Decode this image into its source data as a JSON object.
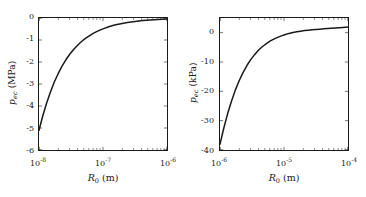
{
  "figure": {
    "background": "#ffffff",
    "line_color": "#1a1a1a",
    "axis_color": "#1a1a1a",
    "panels": [
      "left",
      "right"
    ]
  },
  "chart_data": [
    {
      "type": "line",
      "panel": "left",
      "title": "",
      "xlabel_text": "R0 (m)",
      "xlabel_var": "R",
      "xlabel_sub": "0",
      "xlabel_unit": " (m)",
      "ylabel_var": "p",
      "ylabel_sub": "ec",
      "ylabel_unit": " (MPa)",
      "xscale": "log",
      "yscale": "linear",
      "xlim": [
        1e-08,
        1e-06
      ],
      "ylim": [
        -6,
        0
      ],
      "xticks": [
        1e-08,
        1e-07,
        1e-06
      ],
      "xticklabels": [
        "10−8",
        "10−7",
        "10−6"
      ],
      "xtick_mantissa": [
        "10",
        "10",
        "10"
      ],
      "xtick_exponents": [
        "-8",
        "-7",
        "-6"
      ],
      "yticks": [
        0,
        -1,
        -2,
        -3,
        -4,
        -5,
        -6
      ],
      "yticklabels": [
        "0",
        "-1",
        "-2",
        "-3",
        "-4",
        "-5",
        "-6"
      ],
      "grid": false,
      "legend": null,
      "series": [
        {
          "name": "p_ec vs R0 (MPa)",
          "x": [
            1e-08,
            1.15e-08,
            1.32e-08,
            1.52e-08,
            1.74e-08,
            2e-08,
            2.29e-08,
            2.63e-08,
            3.02e-08,
            3.47e-08,
            3.98e-08,
            4.57e-08,
            5.25e-08,
            6.03e-08,
            6.92e-08,
            7.94e-08,
            9.12e-08,
            1.05e-07,
            1.2e-07,
            1.38e-07,
            1.58e-07,
            1.82e-07,
            2.09e-07,
            2.4e-07,
            2.75e-07,
            3.16e-07,
            3.63e-07,
            4.17e-07,
            4.79e-07,
            5.5e-07,
            6.31e-07,
            7.24e-07,
            8.32e-07,
            1e-06
          ],
          "y": [
            -5.1,
            -4.43,
            -3.85,
            -3.34,
            -2.9,
            -2.52,
            -2.19,
            -1.9,
            -1.65,
            -1.43,
            -1.25,
            -1.08,
            -0.94,
            -0.82,
            -0.71,
            -0.62,
            -0.54,
            -0.47,
            -0.41,
            -0.355,
            -0.31,
            -0.27,
            -0.235,
            -0.205,
            -0.178,
            -0.155,
            -0.135,
            -0.117,
            -0.102,
            -0.089,
            -0.077,
            -0.067,
            -0.058,
            -0.048
          ]
        }
      ]
    },
    {
      "type": "line",
      "panel": "right",
      "title": "",
      "xlabel_text": "R0 (m)",
      "xlabel_var": "R",
      "xlabel_sub": "0",
      "xlabel_unit": " (m)",
      "ylabel_var": "p",
      "ylabel_sub": "ec",
      "ylabel_unit": " (kPa)",
      "xscale": "log",
      "yscale": "linear",
      "xlim": [
        1e-06,
        0.0001
      ],
      "ylim": [
        -40,
        5
      ],
      "xticks": [
        1e-06,
        1e-05,
        0.0001
      ],
      "xticklabels": [
        "10−6",
        "10−5",
        "10−4"
      ],
      "xtick_mantissa": [
        "10",
        "10",
        "10"
      ],
      "xtick_exponents": [
        "-6",
        "-5",
        "-4"
      ],
      "yticks": [
        0,
        -10,
        -20,
        -30,
        -40
      ],
      "yticklabels": [
        "0",
        "-10",
        "-20",
        "-30",
        "-40"
      ],
      "grid": false,
      "legend": null,
      "series": [
        {
          "name": "p_ec vs R0 (kPa)",
          "x": [
            1e-06,
            1.15e-06,
            1.32e-06,
            1.52e-06,
            1.74e-06,
            2e-06,
            2.29e-06,
            2.63e-06,
            3.02e-06,
            3.47e-06,
            3.98e-06,
            4.57e-06,
            5.25e-06,
            6.03e-06,
            6.92e-06,
            7.94e-06,
            9.12e-06,
            1.05e-05,
            1.2e-05,
            1.38e-05,
            1.58e-05,
            1.82e-05,
            2.09e-05,
            2.4e-05,
            2.75e-05,
            3.16e-05,
            3.63e-05,
            4.17e-05,
            4.79e-05,
            5.5e-05,
            6.31e-05,
            7.24e-05,
            8.32e-05,
            0.0001
          ],
          "y": [
            -38.0,
            -32.4,
            -27.5,
            -23.2,
            -19.5,
            -16.3,
            -13.6,
            -11.2,
            -9.2,
            -7.5,
            -6.0,
            -4.8,
            -3.8,
            -2.9,
            -2.2,
            -1.6,
            -1.1,
            -0.6,
            -0.25,
            0.05,
            0.3,
            0.5,
            0.7,
            0.85,
            1.0,
            1.1,
            1.2,
            1.3,
            1.4,
            1.5,
            1.6,
            1.7,
            1.8,
            1.9
          ]
        }
      ]
    }
  ]
}
